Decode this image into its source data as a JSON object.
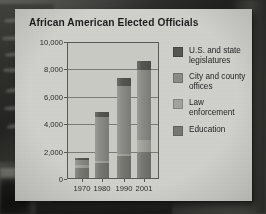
{
  "chart_data": {
    "type": "bar",
    "subtype": "stacked-bar",
    "title": "African American Elected Officials",
    "xlabel": "",
    "ylabel": "",
    "categories": [
      "1970",
      "1980",
      "1990",
      "2001"
    ],
    "ylim": [
      0,
      10000
    ],
    "ytick_values": [
      0,
      2000,
      4000,
      6000,
      8000,
      10000
    ],
    "ytick_labels": [
      "0",
      "2,000",
      "4,000",
      "6,000",
      "8,000",
      "10,000"
    ],
    "grid": true,
    "legend_position": "right",
    "series": [
      {
        "name": "Education",
        "color": "#777772",
        "values": [
          800,
          1200,
          1650,
          1950
        ]
      },
      {
        "name": "Law enforcement",
        "color": "#a2a29c",
        "values": [
          200,
          150,
          150,
          900
        ]
      },
      {
        "name": "City and county offices",
        "color": "#8b8b86",
        "values": [
          400,
          3200,
          5000,
          5100
        ]
      },
      {
        "name": "U.S. and state legislatures",
        "color": "#555551",
        "values": [
          100,
          350,
          600,
          650
        ]
      }
    ],
    "totals": [
      1500,
      4900,
      7400,
      8600
    ]
  },
  "legend": {
    "items": [
      {
        "label": "U.S. and state legislatures",
        "color": "#555551",
        "swatch_name": "legend-swatch-us-state-legislatures"
      },
      {
        "label": "City and county offices",
        "color": "#8b8b86",
        "swatch_name": "legend-swatch-city-county-offices"
      },
      {
        "label": "Law enforcement",
        "color": "#a2a29c",
        "swatch_name": "legend-swatch-law-enforcement"
      },
      {
        "label": "Education",
        "color": "#777772",
        "swatch_name": "legend-swatch-education"
      }
    ]
  },
  "colors": {
    "panel_background": "#cfcfca",
    "plot_background": "#c9c9c4",
    "axis": "#5a5a57",
    "gridline": "#6d6d69",
    "text": "#1d1d1d"
  }
}
